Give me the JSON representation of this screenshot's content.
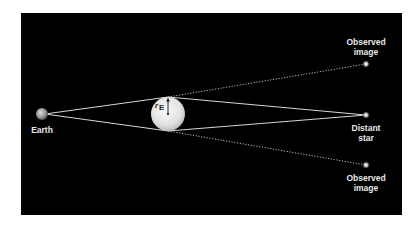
{
  "diagram": {
    "colors": {
      "background": "#000000",
      "page": "#ffffff",
      "line": "#d8d8d8",
      "lens": "#e6e6e6",
      "label": "#e8e8e8"
    },
    "labels": {
      "earth": "Earth",
      "distant_star": [
        "Distant",
        "star"
      ],
      "observed_image_top": [
        "Observed",
        "image"
      ],
      "observed_image_bottom": [
        "Observed",
        "image"
      ],
      "einstein_radius_symbol": "r",
      "einstein_radius_subscript": "E"
    }
  }
}
